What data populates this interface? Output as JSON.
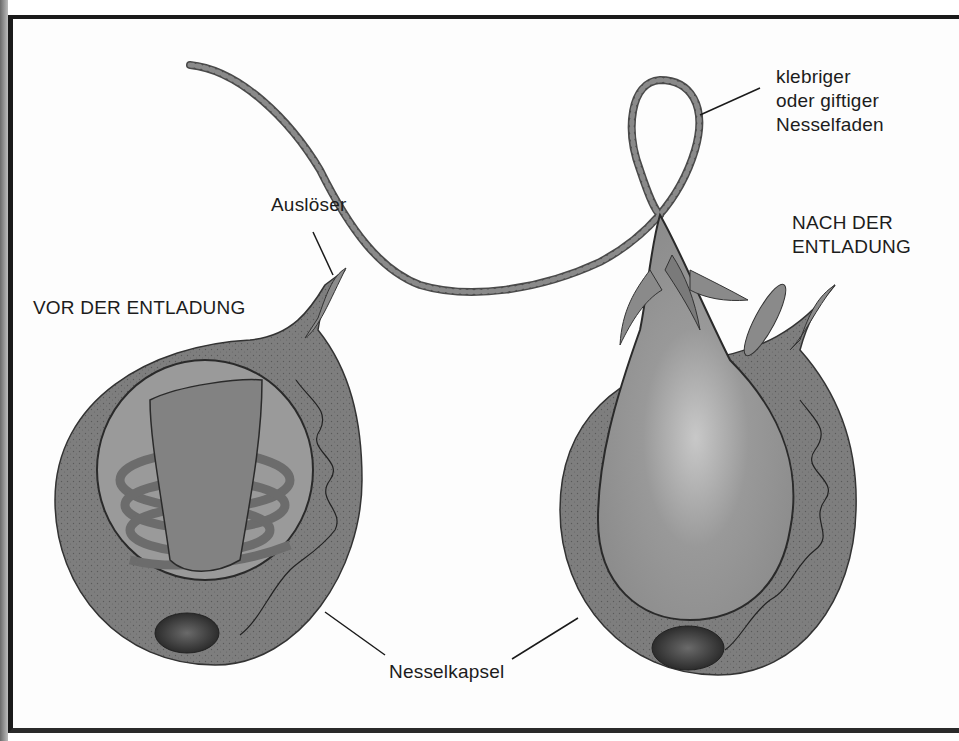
{
  "diagram": {
    "labels": {
      "before_title": "VOR DER ENTLADUNG",
      "after_title_line1": "NACH DER",
      "after_title_line2": "ENTLADUNG",
      "trigger": "Auslöser",
      "thread_line1": "klebriger",
      "thread_line2": "oder giftiger",
      "thread_line3": "Nesselfaden",
      "capsule": "Nesselkapsel"
    },
    "colors": {
      "cell_body": "#7c7c7c",
      "capsule_inner": "#9a9a9a",
      "thread": "#6e6e6e",
      "nucleus": "#3a3a3a",
      "outline": "#222222",
      "frame": "#1a1a1a"
    }
  }
}
